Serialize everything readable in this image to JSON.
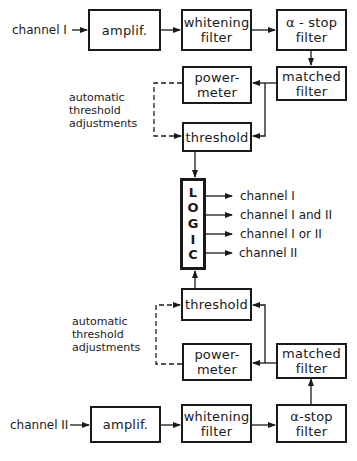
{
  "diagram": {
    "type": "block-diagram",
    "channel1": {
      "input_label": "channel I",
      "blocks": {
        "amplifier": [
          "amplif."
        ],
        "whitening_filter": [
          "whitening",
          "filter"
        ],
        "alpha_stop_filter": [
          "α - stop",
          "filter"
        ],
        "matched_filter": [
          "matched",
          "filter"
        ],
        "power_meter": [
          "power-",
          "meter"
        ],
        "threshold": [
          "threshold"
        ]
      },
      "feedback_label": [
        "automatic",
        "threshold",
        "adjustments"
      ]
    },
    "logic": {
      "letters": [
        "L",
        "O",
        "G",
        "I",
        "C"
      ],
      "outputs": [
        "channel I",
        "channel I and II",
        "channel I or II",
        "channel II"
      ]
    },
    "channel2": {
      "input_label": "channel II",
      "blocks": {
        "amplifier": [
          "amplif."
        ],
        "whitening_filter": [
          "whitening",
          "filter"
        ],
        "alpha_stop_filter": [
          "α-stop",
          "filter"
        ],
        "matched_filter": [
          "matched",
          "filter"
        ],
        "power_meter": [
          "power-",
          "meter"
        ],
        "threshold": [
          "threshold"
        ]
      },
      "feedback_label": [
        "automatic",
        "threshold",
        "adjustments"
      ]
    },
    "edges": [
      [
        "channel I",
        "amplif.1"
      ],
      [
        "amplif.1",
        "whitening1"
      ],
      [
        "whitening1",
        "alphastop1"
      ],
      [
        "alphastop1",
        "matched1"
      ],
      [
        "matched1",
        "powermeter1"
      ],
      [
        "matched1",
        "threshold1"
      ],
      [
        "powermeter1",
        "threshold1",
        "dashed"
      ],
      [
        "threshold1",
        "LOGIC"
      ],
      [
        "channel II",
        "amplif.2"
      ],
      [
        "amplif.2",
        "whitening2"
      ],
      [
        "whitening2",
        "alphastop2"
      ],
      [
        "alphastop2",
        "matched2"
      ],
      [
        "matched2",
        "powermeter2"
      ],
      [
        "matched2",
        "threshold2"
      ],
      [
        "powermeter2",
        "threshold2",
        "dashed"
      ],
      [
        "threshold2",
        "LOGIC"
      ]
    ]
  }
}
